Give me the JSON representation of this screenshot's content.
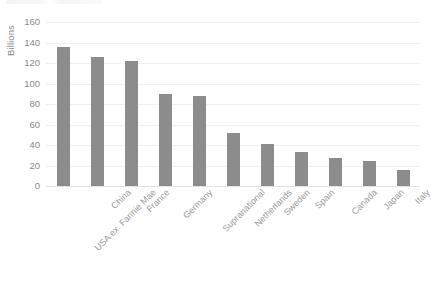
{
  "chart_data": {
    "type": "bar",
    "title": "",
    "subtitle": "",
    "xlabel": "",
    "ylabel": "Billions",
    "ylim": [
      0,
      160
    ],
    "yticks": [
      0,
      20,
      40,
      60,
      80,
      100,
      120,
      140,
      160
    ],
    "ytick_labels": [
      "0",
      "20",
      "40",
      "60",
      "80",
      "100",
      "120",
      "140",
      "160"
    ],
    "grid": "horizontal",
    "legend": "none",
    "bar_color": "#8c8c8c",
    "gridline_color": "#f0f0f2",
    "axis_color": "#e2e2e4",
    "tick_label_color": "#8a8a8a",
    "xlabel_rotation": -45,
    "categories": [
      "USA ex. Fannie Mae",
      "China",
      "France",
      "Germany",
      "Supranational",
      "Netherlands",
      "Sweden",
      "Spain",
      "Canada",
      "Japan",
      "Italy"
    ],
    "values": [
      136,
      126,
      122,
      90,
      88,
      52,
      41,
      33,
      27,
      24,
      16
    ]
  }
}
